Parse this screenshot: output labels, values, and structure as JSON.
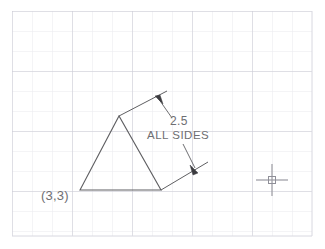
{
  "app": {
    "type": "cad-drawing-canvas",
    "width": 325,
    "height": 249,
    "background_color": "#ffffff"
  },
  "grid": {
    "visible": true,
    "minor_color": "#e9e9ee",
    "major_color": "#c8c8d2",
    "minor_spacing_px": 20,
    "major_every": 3,
    "origin_x_px": 12,
    "origin_y_px": 11,
    "right_edge_px": 312,
    "bottom_edge_px": 236
  },
  "drawing": {
    "line_color": "#5f5f62",
    "text_color": "#6e6e72",
    "triangle": {
      "name": "equilateral-triangle",
      "vertices": [
        {
          "label": "bottom-left",
          "x": 80,
          "y": 190
        },
        {
          "label": "apex",
          "x": 119,
          "y": 116
        },
        {
          "label": "bottom-right",
          "x": 161,
          "y": 190
        }
      ]
    },
    "base_point_label": {
      "text": "(3,3)",
      "x": 42,
      "y": 198
    },
    "dimension": {
      "value_text": "2.5",
      "note_text": "ALL  SIDES",
      "value_x": 170,
      "value_y": 124,
      "note_x": 147,
      "note_y": 137,
      "upper_extension_line": {
        "x1": 119,
        "y1": 116,
        "x2": 167,
        "y2": 91
      },
      "upper_leader_line": {
        "x1": 158,
        "y1": 98,
        "x2": 172,
        "y2": 117
      },
      "upper_arrow_tip": {
        "x": 156,
        "y": 97
      },
      "lower_extension_line": {
        "x1": 161,
        "y1": 190,
        "x2": 207,
        "y2": 163
      },
      "lower_leader_line": {
        "x1": 184,
        "y1": 145,
        "x2": 196,
        "y2": 170
      },
      "lower_arrow_tip": {
        "x": 197,
        "y": 172
      }
    }
  },
  "cursor": {
    "name": "crosshair-cursor",
    "x": 272,
    "y": 180,
    "arm_length_px": 16,
    "pickbox_size_px": 7,
    "color": "#9a9aa2"
  }
}
